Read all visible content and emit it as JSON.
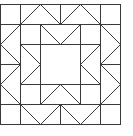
{
  "diagram": {
    "type": "quilt-block-pattern",
    "grid_cells": 6,
    "stroke_color": "#3a3a3a",
    "background_color": "#ffffff",
    "segments_in_cell_units": {
      "outer_square": [
        [
          0,
          0,
          6,
          0
        ],
        [
          6,
          0,
          6,
          6
        ],
        [
          6,
          6,
          0,
          6
        ],
        [
          0,
          6,
          0,
          0
        ]
      ],
      "grid_lines": [
        [
          0,
          1,
          6,
          1
        ],
        [
          0,
          5,
          6,
          5
        ],
        [
          1,
          0,
          1,
          6
        ],
        [
          5,
          0,
          5,
          6
        ],
        [
          1,
          2,
          5,
          2
        ],
        [
          1,
          4,
          5,
          4
        ],
        [
          2,
          1,
          2,
          5
        ],
        [
          4,
          1,
          4,
          5
        ],
        [
          3,
          0,
          3,
          1
        ],
        [
          3,
          5,
          3,
          6
        ],
        [
          0,
          3,
          1,
          3
        ],
        [
          5,
          3,
          6,
          3
        ]
      ],
      "outer_zigzags": [
        [
          1,
          1,
          2,
          0
        ],
        [
          2,
          0,
          3,
          1
        ],
        [
          3,
          1,
          4,
          0
        ],
        [
          4,
          0,
          5,
          1
        ],
        [
          1,
          5,
          2,
          6
        ],
        [
          2,
          6,
          3,
          5
        ],
        [
          3,
          5,
          4,
          6
        ],
        [
          4,
          6,
          5,
          5
        ],
        [
          1,
          1,
          0,
          2
        ],
        [
          0,
          2,
          1,
          3
        ],
        [
          1,
          3,
          0,
          4
        ],
        [
          0,
          4,
          1,
          5
        ],
        [
          5,
          1,
          6,
          2
        ],
        [
          6,
          2,
          5,
          3
        ],
        [
          5,
          3,
          6,
          4
        ],
        [
          6,
          4,
          5,
          5
        ]
      ],
      "inner_points": [
        [
          2,
          1,
          3,
          2
        ],
        [
          3,
          2,
          4,
          1
        ],
        [
          2,
          5,
          3,
          4
        ],
        [
          3,
          4,
          4,
          5
        ],
        [
          1,
          2,
          2,
          3
        ],
        [
          2,
          3,
          1,
          4
        ],
        [
          5,
          2,
          4,
          3
        ],
        [
          4,
          3,
          5,
          4
        ]
      ]
    }
  }
}
